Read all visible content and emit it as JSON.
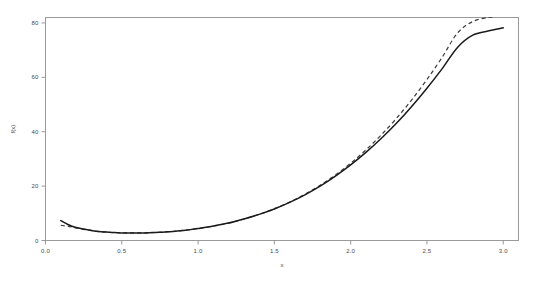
{
  "chart_data": {
    "type": "line",
    "title": "",
    "subtitle": "",
    "xlabel": "x",
    "ylabel": "f(x)",
    "xlim": [
      0.0,
      3.1
    ],
    "ylim": [
      0,
      82
    ],
    "xticks": [
      "0.0",
      "0.5",
      "1.0",
      "1.5",
      "2.0",
      "2.5",
      "3.0"
    ],
    "xtick_values": [
      0.0,
      0.5,
      1.0,
      1.5,
      2.0,
      2.5,
      3.0
    ],
    "yticks": [
      "0",
      "20",
      "40",
      "60",
      "80"
    ],
    "ytick_values": [
      0,
      20,
      40,
      60,
      80
    ],
    "grid": false,
    "legend": "none",
    "legend_position": "none",
    "frame": true,
    "colors": {
      "solid_curve": "#1a1a1a",
      "dashed_curve": "#3c3c3c",
      "axis": "#8c8c8c",
      "text": "#4a4a4a",
      "background": "#ffffff"
    },
    "series": [
      {
        "name": "solid",
        "style": "solid",
        "color": "#1a1a1a",
        "x": [
          0.1,
          0.15,
          0.2,
          0.25,
          0.3,
          0.35,
          0.4,
          0.45,
          0.5,
          0.55,
          0.6,
          0.65,
          0.7,
          0.75,
          0.8,
          0.85,
          0.9,
          0.95,
          1.0,
          1.1,
          1.2,
          1.3,
          1.4,
          1.5,
          1.6,
          1.7,
          1.8,
          1.9,
          2.0,
          2.1,
          2.2,
          2.3,
          2.4,
          2.5,
          2.6,
          2.7,
          2.8,
          2.9,
          3.0
        ],
        "y": [
          7.3,
          5.8,
          4.8,
          4.2,
          3.7,
          3.3,
          3.1,
          2.9,
          2.8,
          2.8,
          2.8,
          2.8,
          2.9,
          3.0,
          3.2,
          3.4,
          3.7,
          4.0,
          4.4,
          5.3,
          6.4,
          7.9,
          9.6,
          11.6,
          14.0,
          16.8,
          20.0,
          23.7,
          27.8,
          32.4,
          37.5,
          43.1,
          49.3,
          56.0,
          63.2,
          71.0,
          75.5,
          77.0,
          78.2
        ]
      },
      {
        "name": "dashed",
        "style": "dashed",
        "color": "#3c3c3c",
        "x": [
          0.1,
          0.15,
          0.2,
          0.25,
          0.3,
          0.35,
          0.4,
          0.45,
          0.5,
          0.55,
          0.6,
          0.65,
          0.7,
          0.75,
          0.8,
          0.85,
          0.9,
          0.95,
          1.0,
          1.1,
          1.2,
          1.3,
          1.4,
          1.5,
          1.6,
          1.7,
          1.8,
          1.9,
          2.0,
          2.1,
          2.2,
          2.3,
          2.4,
          2.5,
          2.6,
          2.7,
          2.8,
          2.9,
          2.95
        ],
        "y": [
          5.6,
          5.2,
          4.6,
          4.1,
          3.7,
          3.3,
          3.1,
          2.9,
          2.8,
          2.8,
          2.8,
          2.8,
          2.9,
          3.0,
          3.2,
          3.4,
          3.7,
          4.0,
          4.4,
          5.3,
          6.4,
          7.9,
          9.6,
          11.7,
          14.1,
          17.0,
          20.3,
          24.1,
          28.4,
          33.3,
          38.8,
          44.9,
          51.7,
          59.2,
          67.4,
          76.3,
          80.5,
          82.0,
          82.0
        ]
      }
    ]
  }
}
